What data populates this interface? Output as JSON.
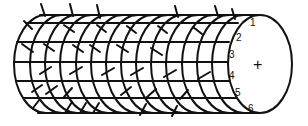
{
  "diagram": {
    "type": "cylinder-lattice",
    "end_face_symbol": "+",
    "row_labels": [
      "1",
      "2",
      "3",
      "4",
      "5",
      "6"
    ],
    "colors": {
      "stroke": "#111111",
      "background": "#ffffff"
    }
  }
}
